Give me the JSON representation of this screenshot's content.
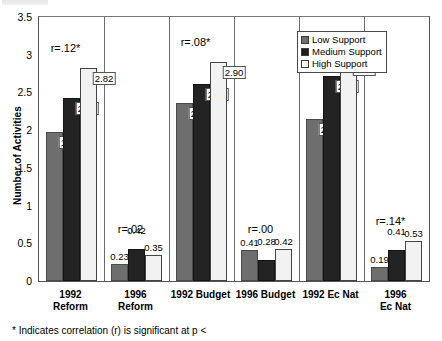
{
  "chart_data": {
    "type": "bar",
    "title": "",
    "xlabel": "",
    "ylabel": "Number of Activities",
    "ylim": [
      0,
      3.5
    ],
    "ytick_labels": [
      "0",
      "0.5",
      "1",
      "1.5",
      "2",
      "2.5",
      "3",
      "3.5"
    ],
    "ytick_values": [
      0,
      0.5,
      1,
      1.5,
      2,
      2.5,
      3,
      3.5
    ],
    "grid": false,
    "legend_position": "top-right",
    "categories": [
      "1992\nReform",
      "1996\nReform",
      "1992 Budget",
      "1996 Budget",
      "1992 Ec Nat",
      "1996 Ec Nat"
    ],
    "series": [
      {
        "name": "Low Support",
        "color": "#6e6e6e",
        "values": [
          1.98,
          0.23,
          2.36,
          0.41,
          2.15,
          0.19
        ]
      },
      {
        "name": "Medium Support",
        "color": "#232323",
        "values": [
          2.43,
          0.42,
          2.61,
          0.28,
          2.72,
          0.41
        ]
      },
      {
        "name": "High Support",
        "color": "#f2f2f2",
        "values": [
          2.82,
          0.35,
          2.9,
          0.42,
          2.94,
          0.53
        ]
      }
    ],
    "annotations": [
      {
        "text": "r=.12*",
        "category": "1992 Reform"
      },
      {
        "text": "r=.02",
        "category": "1996 Reform"
      },
      {
        "text": "r=.08*",
        "category": "1992 Budget"
      },
      {
        "text": "r=.00",
        "category": "1996 Budget"
      },
      {
        "text": "r=.13*",
        "category": "1992 Ec Nat"
      },
      {
        "text": "r=.14*",
        "category": "1996 Ec Nat"
      }
    ],
    "footnote": "* Indicates correlation (r) is significant at p <"
  },
  "legend": {
    "items": [
      {
        "label": "Low Support"
      },
      {
        "label": "Medium Support"
      },
      {
        "label": "High Support"
      }
    ]
  },
  "axis": {
    "y_title": "Number of Activities",
    "y_labels": [
      "3.5",
      "3",
      "2.5",
      "2",
      "1.5",
      "1",
      "0.5",
      "0"
    ]
  },
  "footnote": {
    "text": "* Indicates correlation (r) is significant at p <"
  }
}
